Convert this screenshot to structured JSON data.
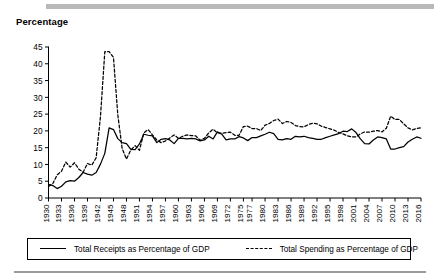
{
  "chart_data": {
    "type": "line",
    "title": "",
    "ylabel": "Percentage",
    "xlabel": "",
    "ylim": [
      0,
      45
    ],
    "xlim": [
      1930,
      2017
    ],
    "ytick_step": 5,
    "yticks": [
      0,
      5,
      10,
      15,
      20,
      25,
      30,
      35,
      40,
      45
    ],
    "grid": false,
    "legend_position": "bottom",
    "xtick_labels": [
      "1930",
      "1933",
      "1936",
      "1939",
      "1942",
      "1945",
      "1948",
      "1951",
      "1954",
      "1957",
      "1960",
      "1963",
      "1966",
      "1969",
      "1972",
      "1975",
      "1977",
      "1980",
      "1983",
      "1986",
      "1989",
      "1992",
      "1995",
      "1998",
      "2001",
      "2004",
      "2007",
      "2010",
      "2013",
      "2016"
    ],
    "x": [
      1930,
      1931,
      1932,
      1933,
      1934,
      1935,
      1936,
      1937,
      1938,
      1939,
      1940,
      1941,
      1942,
      1943,
      1944,
      1945,
      1946,
      1947,
      1948,
      1949,
      1950,
      1951,
      1952,
      1953,
      1954,
      1955,
      1956,
      1957,
      1958,
      1959,
      1960,
      1961,
      1962,
      1963,
      1964,
      1965,
      1966,
      1967,
      1968,
      1969,
      1970,
      1971,
      1972,
      1973,
      1974,
      1975,
      1976,
      1977,
      1978,
      1979,
      1980,
      1981,
      1982,
      1983,
      1984,
      1985,
      1986,
      1987,
      1988,
      1989,
      1990,
      1991,
      1992,
      1993,
      1994,
      1995,
      1996,
      1997,
      1998,
      1999,
      2000,
      2001,
      2002,
      2003,
      2004,
      2005,
      2006,
      2007,
      2008,
      2009,
      2010,
      2011,
      2012,
      2013,
      2014,
      2015,
      2016
    ],
    "series": [
      {
        "name": "Total Receipts as Percentage of GDP",
        "style": "solid",
        "color": "#000000",
        "values": [
          4.1,
          3.7,
          2.8,
          3.5,
          4.8,
          5.2,
          5.0,
          6.1,
          7.6,
          7.1,
          6.8,
          7.6,
          10.1,
          13.3,
          20.9,
          20.4,
          17.7,
          16.5,
          16.2,
          14.5,
          14.4,
          16.1,
          19.0,
          18.7,
          18.5,
          16.5,
          17.5,
          17.7,
          17.3,
          16.2,
          17.8,
          17.8,
          17.6,
          17.8,
          17.6,
          17.0,
          17.3,
          18.4,
          17.6,
          19.7,
          19.0,
          17.3,
          17.6,
          17.6,
          18.3,
          17.9,
          17.1,
          18.0,
          18.0,
          18.5,
          19.0,
          19.6,
          19.2,
          17.5,
          17.3,
          17.7,
          17.5,
          18.4,
          18.2,
          18.4,
          18.0,
          17.8,
          17.5,
          17.5,
          18.0,
          18.4,
          18.8,
          19.2,
          19.9,
          19.8,
          20.6,
          19.5,
          17.6,
          16.2,
          16.1,
          17.3,
          18.2,
          18.0,
          17.6,
          14.6,
          14.6,
          15.0,
          15.3,
          16.7,
          17.5,
          18.2,
          17.8
        ]
      },
      {
        "name": "Total Spending as Percentage of GDP",
        "style": "dashed",
        "color": "#000000",
        "values": [
          3.4,
          4.3,
          6.9,
          8.0,
          10.7,
          9.2,
          10.5,
          8.6,
          7.7,
          10.3,
          9.8,
          12.0,
          24.3,
          43.6,
          43.6,
          41.9,
          24.8,
          14.8,
          11.6,
          14.3,
          15.6,
          14.2,
          19.4,
          20.4,
          18.8,
          17.3,
          16.5,
          17.0,
          17.9,
          18.8,
          17.8,
          18.4,
          18.8,
          18.6,
          18.5,
          17.2,
          17.8,
          19.4,
          20.5,
          19.4,
          19.3,
          19.5,
          19.6,
          18.7,
          18.7,
          21.3,
          21.4,
          20.7,
          20.7,
          20.1,
          21.7,
          22.2,
          23.1,
          23.5,
          22.2,
          22.8,
          22.5,
          21.6,
          21.3,
          21.2,
          21.9,
          22.3,
          22.1,
          21.4,
          21.0,
          20.6,
          20.2,
          19.5,
          19.1,
          18.5,
          18.2,
          18.2,
          19.1,
          19.7,
          19.6,
          19.9,
          20.1,
          19.7,
          20.8,
          24.4,
          23.4,
          23.4,
          22.1,
          20.9,
          20.3,
          20.7,
          20.9
        ]
      }
    ]
  },
  "figure": {
    "y_axis_title": "Percentage",
    "legend": {
      "items": [
        {
          "label": "Total Receipts as Percentage of GDP",
          "style": "solid"
        },
        {
          "label": "Total Spending as Percentage of GDP",
          "style": "dashed"
        }
      ]
    }
  }
}
